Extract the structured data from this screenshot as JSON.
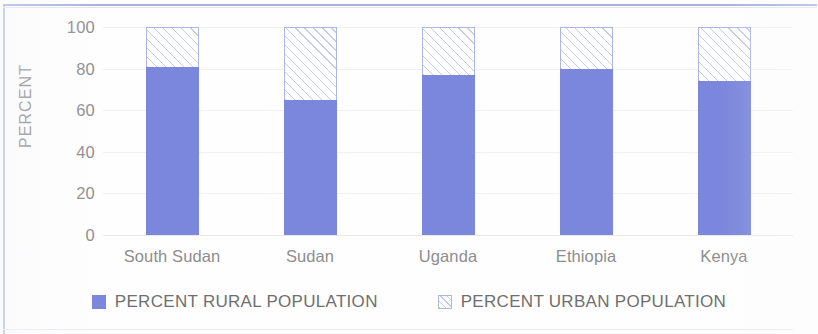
{
  "chart_data": {
    "type": "bar",
    "title": "",
    "subtitle": "",
    "stacked": true,
    "stacked_total": 100,
    "xlabel": "",
    "ylabel": "PERCENT",
    "ylim": [
      0,
      100
    ],
    "ytick_values": [
      100,
      80,
      60,
      40,
      20,
      0
    ],
    "ytick_labels": [
      "100",
      "80",
      "60",
      "40",
      "20",
      "0"
    ],
    "grid": true,
    "grid_axis": "y",
    "legend_position": "bottom",
    "categories": [
      "South Sudan",
      "Sudan",
      "Uganda",
      "Ethiopia",
      "Kenya"
    ],
    "series": [
      {
        "name": "PERCENT RURAL POPULATION",
        "values": [
          81,
          65,
          77,
          80,
          74
        ],
        "color": "#7b86dd",
        "fill": "solid"
      },
      {
        "name": "PERCENT URBAN POPULATION",
        "values": [
          19,
          35,
          23,
          20,
          26
        ],
        "color": "#ffffff",
        "hatch_color": "#c3cbe9",
        "border_color": "#aeb7e4",
        "fill": "diagonal-hatch"
      }
    ]
  },
  "legend": {
    "items": [
      {
        "label": "PERCENT RURAL POPULATION",
        "swatch": "solid-square-icon"
      },
      {
        "label": "PERCENT URBAN POPULATION",
        "swatch": "hatched-square-icon"
      }
    ]
  },
  "colors": {
    "rural": "#7b86dd",
    "urban_hatch": "#c3cbe9",
    "urban_border": "#aeb7e4",
    "frame": "#b9c0e6",
    "text": "#8d8d8d",
    "grid": "#f0f0ef",
    "background": "#fefefe"
  }
}
